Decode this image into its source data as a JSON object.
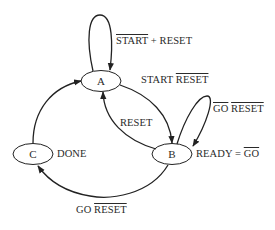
{
  "diagram": {
    "type": "state-machine",
    "nodes": [
      {
        "id": "A",
        "label": "A"
      },
      {
        "id": "B",
        "label": "B",
        "output": "READY = GO̅",
        "output_parts": [
          "READY = ",
          "GO"
        ]
      },
      {
        "id": "C",
        "label": "C",
        "output": "DONE"
      }
    ],
    "edges": [
      {
        "from": "A",
        "to": "A",
        "label_parts": [
          "START",
          " + RESET"
        ],
        "overlined": [
          "START"
        ]
      },
      {
        "from": "A",
        "to": "B",
        "label_parts": [
          "START ",
          "RESET"
        ],
        "overlined": [
          "RESET"
        ]
      },
      {
        "from": "B",
        "to": "A",
        "label_parts": [
          "RESET"
        ],
        "overlined": []
      },
      {
        "from": "B",
        "to": "B",
        "label_parts": [
          "GO",
          " ",
          "RESET"
        ],
        "overlined": [
          "GO",
          "RESET"
        ]
      },
      {
        "from": "B",
        "to": "C",
        "label_parts": [
          "GO ",
          "RESET"
        ],
        "overlined": [
          "RESET"
        ]
      },
      {
        "from": "C",
        "to": "A",
        "label_parts": [],
        "overlined": []
      }
    ],
    "colors": {
      "stroke": "#222222",
      "text": "#2a2a2a",
      "background": "#ffffff"
    }
  }
}
